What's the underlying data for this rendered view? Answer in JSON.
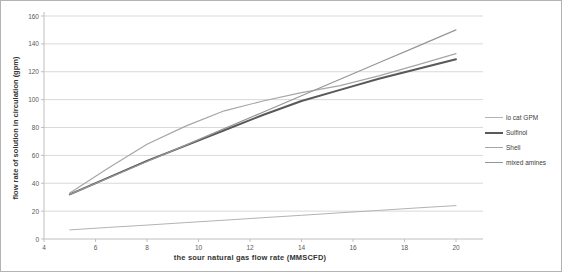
{
  "chart_data": {
    "type": "line",
    "title": "",
    "xlabel": "the sour natural gas flow rate (MMSCFD)",
    "ylabel": "flow rate of solution in circulation (gpm)",
    "x": [
      5,
      6.5,
      8,
      9.5,
      11,
      12.5,
      14,
      15.5,
      17,
      18.5,
      20
    ],
    "xlim": [
      4,
      21
    ],
    "ylim": [
      0,
      160
    ],
    "x_ticks": [
      4,
      6,
      8,
      10,
      12,
      14,
      16,
      18,
      20
    ],
    "y_ticks": [
      0,
      20,
      40,
      60,
      80,
      100,
      120,
      140,
      160
    ],
    "grid": "horizontal",
    "gridline_color": "#d9d9d9",
    "axis_color": "#bfbfbf",
    "legend_position": "right-outside",
    "series": [
      {
        "name": "lo cat GPM",
        "color": "#b3b3b3",
        "width": 1,
        "values": [
          6.5,
          8.3,
          10,
          11.8,
          13.5,
          15.3,
          17,
          18.8,
          20.5,
          22.3,
          24
        ]
      },
      {
        "name": "Sulfinol",
        "color": "#595959",
        "width": 2,
        "values": [
          32,
          44,
          56,
          67,
          78,
          89,
          99,
          107,
          115,
          122,
          129
        ]
      },
      {
        "name": "Shell",
        "color": "#a6a6a6",
        "width": 1.2,
        "values": [
          33,
          51,
          68,
          81,
          92,
          99,
          105,
          110,
          117,
          125,
          133
        ]
      },
      {
        "name": "mixed amines",
        "color": "#969696",
        "width": 1.2,
        "values": [
          32,
          43.8,
          55.6,
          67.4,
          79.2,
          91,
          102.8,
          114.6,
          126.4,
          138.2,
          150
        ]
      }
    ]
  }
}
